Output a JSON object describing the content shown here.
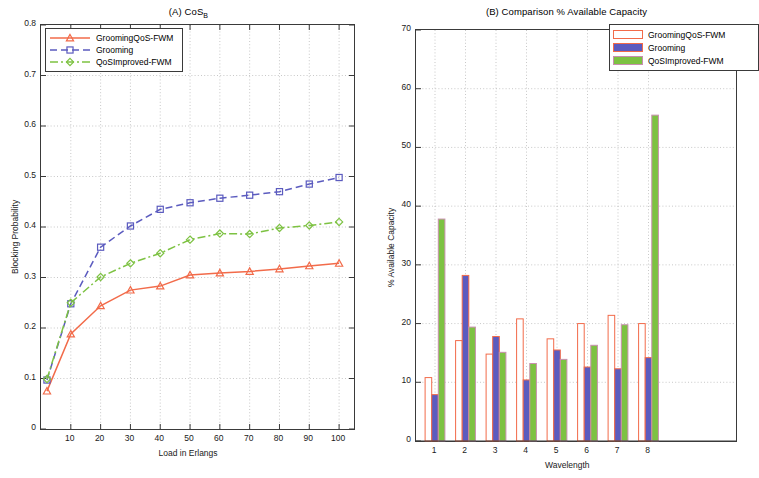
{
  "figure": {
    "panel_a_title_main": "(A) CoS",
    "panel_a_title_sub": "B",
    "panel_b_title": "(B) Comparison % Available Capacity"
  },
  "colors": {
    "series1": "#F26B4A",
    "series2": "#5B5BBF",
    "series3": "#7DC242",
    "axis": "#3a3a3a",
    "grid": "#b0b0b0"
  },
  "legend_a": {
    "items": [
      {
        "label": "GroomingQoS-FWM",
        "marker": "triangle-marker",
        "line": "solid"
      },
      {
        "label": "Grooming",
        "marker": "square-marker",
        "line": "dashed"
      },
      {
        "label": "QoSImproved-FWM",
        "marker": "diamond-marker",
        "line": "dashdot"
      }
    ]
  },
  "legend_b": {
    "items": [
      {
        "label": "GroomingQoS-FWM"
      },
      {
        "label": "Grooming"
      },
      {
        "label": "QoSImproved-FWM"
      }
    ]
  },
  "chart_data": [
    {
      "type": "line",
      "title": "(A) CoS_B",
      "xlabel": "Load in Erlangs",
      "ylabel": "Blocking Probability",
      "xlim": [
        0,
        105
      ],
      "ylim": [
        0,
        0.8
      ],
      "xticks": [
        10,
        20,
        30,
        40,
        50,
        60,
        70,
        80,
        90,
        100
      ],
      "yticks": [
        0,
        0.1,
        0.2,
        0.3,
        0.4,
        0.5,
        0.6,
        0.7,
        0.8
      ],
      "ytick_labels": [
        "0",
        "0.1",
        "0.2",
        "0.3",
        "0.4",
        "0.5",
        "0.6",
        "0.7",
        "0.8"
      ],
      "grid": true,
      "legend_position": "upper-left",
      "x": [
        2,
        10,
        20,
        30,
        40,
        50,
        60,
        70,
        80,
        90,
        100
      ],
      "series": [
        {
          "name": "GroomingQoS-FWM",
          "color": "#F26B4A",
          "marker": "triangle",
          "line": "solid",
          "values": [
            0.075,
            0.188,
            0.244,
            0.275,
            0.283,
            0.305,
            0.309,
            0.312,
            0.317,
            0.323,
            0.328
          ]
        },
        {
          "name": "Grooming",
          "color": "#5B5BBF",
          "marker": "square",
          "line": "dashed",
          "values": [
            0.097,
            0.248,
            0.36,
            0.402,
            0.435,
            0.448,
            0.457,
            0.463,
            0.47,
            0.485,
            0.498
          ]
        },
        {
          "name": "QoSImproved-FWM",
          "color": "#7DC242",
          "marker": "diamond",
          "line": "dashdot",
          "values": [
            0.099,
            0.25,
            0.301,
            0.328,
            0.348,
            0.375,
            0.387,
            0.386,
            0.398,
            0.403,
            0.41
          ]
        }
      ]
    },
    {
      "type": "bar",
      "title": "(B) Comparison % Available Capacity",
      "xlabel": "Wavelength",
      "ylabel": "% Available Capacity",
      "ylim": [
        0,
        70
      ],
      "yticks": [
        0,
        10,
        20,
        30,
        40,
        50,
        60,
        70
      ],
      "ytick_labels": [
        "0",
        "10",
        "20",
        "30",
        "40",
        "50",
        "60",
        "70"
      ],
      "categories": [
        "1",
        "2",
        "3",
        "4",
        "5",
        "6",
        "7",
        "8"
      ],
      "grid": true,
      "legend_position": "upper-right",
      "series": [
        {
          "name": "GroomingQoS-FWM",
          "color": "#FFFFFF",
          "edge": "#F26B4A",
          "values": [
            10.8,
            17.1,
            14.8,
            20.8,
            17.4,
            20.0,
            21.4,
            20.0
          ]
        },
        {
          "name": "Grooming",
          "color": "#5B5BBF",
          "edge": "#F26B4A",
          "values": [
            7.9,
            28.2,
            17.8,
            10.4,
            15.5,
            12.6,
            12.3,
            14.2
          ]
        },
        {
          "name": "QoSImproved-FWM",
          "color": "#7DC242",
          "edge": "#C88FAE",
          "values": [
            37.8,
            19.4,
            15.1,
            13.2,
            13.9,
            16.3,
            19.8,
            55.5
          ]
        }
      ]
    }
  ]
}
